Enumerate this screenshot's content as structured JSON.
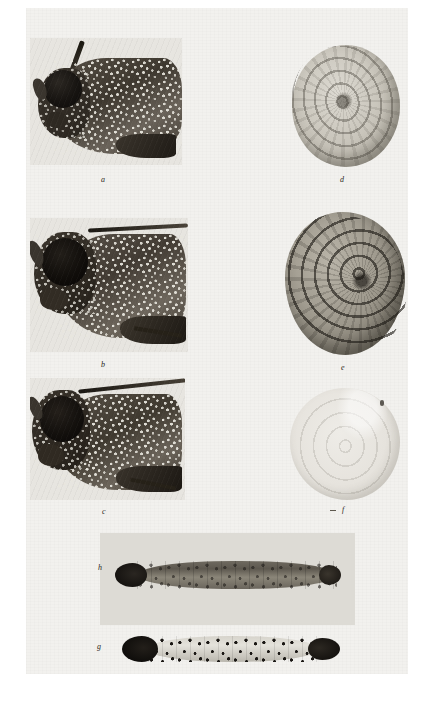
{
  "plate": {
    "kind": "scanned-photographic-figure-plate",
    "background_color": "#ffffff",
    "paper_color": "#f2f1ee",
    "caption_style": "italic lowercase letters"
  },
  "figures": [
    {
      "id": "a",
      "label": "a",
      "subject": "moth head and thorax, lateral view",
      "column": "left",
      "row": 1,
      "label_x": 103,
      "label_y": 181,
      "box": {
        "x": 30,
        "y": 38,
        "w": 152,
        "h": 127
      },
      "tone": "dark grey halftone, speckled scales, large black compound eye facing left"
    },
    {
      "id": "b",
      "label": "b",
      "subject": "moth head and thorax with antenna, lateral view",
      "column": "left",
      "row": 2,
      "label_x": 103,
      "label_y": 366,
      "box": {
        "x": 30,
        "y": 218,
        "w": 158,
        "h": 134
      },
      "tone": "dark grey halftone, very black round eye, long filiform antenna to the right"
    },
    {
      "id": "c",
      "label": "c",
      "subject": "moth head and thorax, lateral view",
      "column": "left",
      "row": 3,
      "label_x": 104,
      "label_y": 513,
      "box": {
        "x": 30,
        "y": 378,
        "w": 155,
        "h": 122
      },
      "tone": "dark grey halftone, black eye, antenna arching to upper right"
    },
    {
      "id": "d",
      "label": "d",
      "subject": "cocoon, spiral silk structure, top view",
      "column": "right",
      "row": 1,
      "label_x": 342,
      "label_y": 181,
      "box": {
        "x": 292,
        "y": 45,
        "w": 108,
        "h": 123
      },
      "tone": "light grey, concentric spiral silk coils"
    },
    {
      "id": "e",
      "label": "e",
      "subject": "cocoon, coarsely coiled silk, oblique view",
      "column": "right",
      "row": 2,
      "label_x": 343,
      "label_y": 369,
      "box": {
        "x": 285,
        "y": 212,
        "w": 120,
        "h": 143
      },
      "tone": "mid-to-dark grey, bold spiral ridges, strongly textured"
    },
    {
      "id": "f",
      "label": "f",
      "subject": "cocoon, faint pale specimen",
      "column": "right",
      "row": 3,
      "label_x": 344,
      "label_y": 512,
      "box": {
        "x": 290,
        "y": 388,
        "w": 110,
        "h": 112
      },
      "tone": "very pale, low contrast, faint concentric rings"
    },
    {
      "id": "h",
      "label": "h",
      "subject": "larva, dorsal view, dark pigmented",
      "column": "bottom",
      "row": 4,
      "label_x": 100,
      "label_y": 569,
      "box": {
        "x": 115,
        "y": 558,
        "w": 226,
        "h": 34
      },
      "tone": "grey-brown segmented body, black head capsule at left"
    },
    {
      "id": "g",
      "label": "g",
      "subject": "larva, dorsal view, pale with dark pinacula",
      "column": "bottom",
      "row": 5,
      "label_x": 99,
      "label_y": 648,
      "box": {
        "x": 122,
        "y": 634,
        "w": 218,
        "h": 30
      },
      "tone": "pale cream body with rows of black spots, black head at left and dark anal plate at right"
    }
  ],
  "larva_plate": {
    "box": {
      "x": 100,
      "y": 533,
      "w": 255,
      "h": 92
    },
    "background_color": "#dddbd5"
  }
}
